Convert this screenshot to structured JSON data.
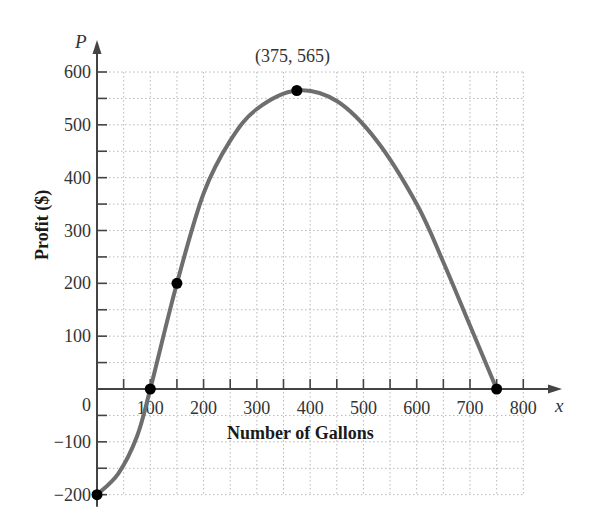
{
  "chart_data": {
    "type": "line",
    "title": "",
    "xlabel": "Number of Gallons",
    "ylabel": "Profit ($)",
    "x_axis_variable": "x",
    "y_axis_variable": "P",
    "xlim": [
      0,
      800
    ],
    "ylim": [
      -200,
      600
    ],
    "x_ticks": [
      100,
      200,
      300,
      400,
      500,
      600,
      700,
      800
    ],
    "x_tick_labels": [
      "100",
      "200",
      "300",
      "400",
      "500",
      "600",
      "700",
      "800"
    ],
    "y_ticks": [
      -200,
      -100,
      0,
      100,
      200,
      300,
      400,
      500,
      600
    ],
    "y_tick_labels": [
      "−200",
      "−100",
      "0",
      "100",
      "200",
      "300",
      "400",
      "500",
      "600"
    ],
    "grid": true,
    "grid_step": 50,
    "series": [
      {
        "name": "Profit curve",
        "color": "#6e6e6e",
        "points_marked": [
          {
            "x": 0,
            "y": -200
          },
          {
            "x": 100,
            "y": 0
          },
          {
            "x": 150,
            "y": 200
          },
          {
            "x": 375,
            "y": 565
          },
          {
            "x": 750,
            "y": 0
          }
        ]
      }
    ],
    "annotations": [
      {
        "text": "(375, 565)",
        "x": 375,
        "y": 565
      }
    ]
  },
  "labels": {
    "x_var": "x",
    "y_var": "P",
    "x_title": "Number of Gallons",
    "y_title": "Profit ($)",
    "vertex": "(375, 565)",
    "origin": "0"
  }
}
